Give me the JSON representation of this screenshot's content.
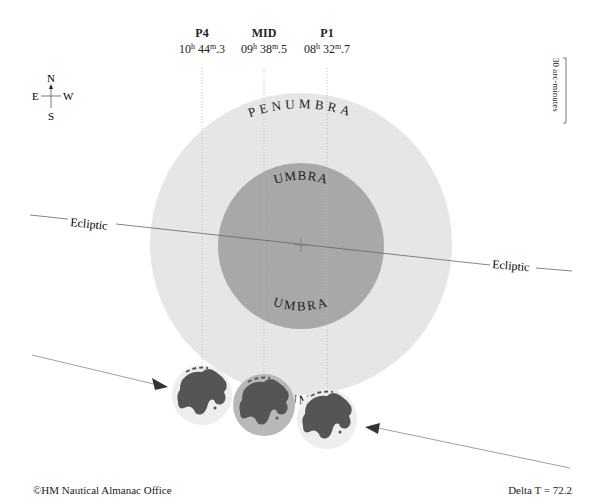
{
  "contacts": [
    {
      "name": "P4",
      "h": "10",
      "m": "44",
      "s": "3",
      "x": 202
    },
    {
      "name": "MID",
      "h": "09",
      "m": "38",
      "s": "5",
      "x": 264
    },
    {
      "name": "P1",
      "h": "08",
      "m": "32",
      "s": "7",
      "x": 327
    }
  ],
  "compass": {
    "north": "N",
    "south": "S",
    "east": "E",
    "west": "W"
  },
  "scale": {
    "label": "30 arc-minutes"
  },
  "shadow": {
    "penumbra_label": "PENUMBRA",
    "umbra_label": "UMBRA",
    "penumbra_color": "#e6e6e6",
    "umbra_color": "#a8a8a8"
  },
  "ecliptic": {
    "label": "Ecliptic"
  },
  "footer": {
    "copyright": "©HM Nautical Almanac Office",
    "delta_t": "Delta T = 72.2"
  }
}
